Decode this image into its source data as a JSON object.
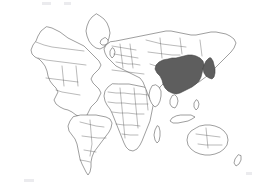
{
  "figure": {
    "type": "world-map",
    "projection": "equirectangular",
    "width": 258,
    "height": 184,
    "background_color": "#ffffff",
    "outline_color": "#4e4e4e",
    "internal_border_color": "#5a5a5a",
    "highlight_fill_color": "#5e5e5e",
    "unhighlighted_fill_color": "#ffffff",
    "has_title": false,
    "has_legend": false,
    "has_labels": false,
    "has_graticule": false
  },
  "highlighted_regions": [
    {
      "name": "China",
      "fill": "#5e5e5e"
    },
    {
      "name": "Japan",
      "fill": "#5e5e5e"
    }
  ],
  "unhighlighted_regions": [
    "North America",
    "Greenland",
    "South America",
    "Europe",
    "Africa",
    "Madagascar",
    "Russia",
    "Middle East",
    "India",
    "Southeast Asia",
    "Indonesia",
    "Philippines",
    "Australia",
    "New Zealand",
    "Iceland",
    "British Isles",
    "Japan"
  ],
  "shapes": {
    "north_america": "M 46 27 L 41 31 L 38 36 L 36 41 L 33 45 L 31 50 L 32 54 L 35 57 L 39 59 L 42 62 L 45 66 L 47 71 L 48 76 L 50 81 L 53 85 L 56 88 L 58 92 L 56 96 L 54 100 L 56 104 L 60 107 L 64 109 L 68 110 L 72 112 L 76 115 L 80 117 L 84 118 L 87 115 L 89 111 L 91 107 L 94 104 L 97 101 L 99 97 L 101 93 L 99 89 L 96 86 L 93 83 L 91 79 L 93 75 L 96 72 L 99 69 L 101 65 L 99 61 L 96 58 L 93 55 L 90 52 L 87 49 L 84 46 L 80 44 L 76 42 L 72 40 L 68 38 L 64 35 L 60 32 L 56 30 L 52 28 L 48 27 Z",
    "greenland": "M 96 14 L 92 17 L 89 21 L 87 26 L 86 31 L 87 36 L 89 41 L 92 45 L 96 48 L 100 49 L 104 47 L 107 43 L 109 38 L 110 33 L 109 28 L 107 23 L 104 19 L 100 16 Z",
    "south_america": "M 73 117 L 70 121 L 68 126 L 69 131 L 72 135 L 75 139 L 77 144 L 78 149 L 79 154 L 80 159 L 82 164 L 84 168 L 86 172 L 88 175 L 90 172 L 91 167 L 91 162 L 92 157 L 94 152 L 97 148 L 100 144 L 103 140 L 106 136 L 109 132 L 111 128 L 112 123 L 110 119 L 106 117 L 101 116 L 96 115 L 91 115 L 86 115 L 81 115 Z",
    "africa": "M 112 84 L 108 87 L 105 91 L 104 96 L 105 101 L 107 105 L 110 109 L 112 113 L 114 118 L 116 123 L 118 128 L 120 133 L 122 138 L 124 143 L 126 147 L 129 150 L 133 151 L 137 149 L 140 145 L 142 141 L 144 136 L 146 131 L 148 126 L 150 121 L 151 116 L 152 111 L 153 106 L 154 101 L 153 96 L 151 92 L 148 89 L 144 87 L 139 86 L 134 85 L 129 84 L 124 84 L 119 84 Z",
    "madagascar": "M 157 126 L 155 130 L 154 135 L 155 140 L 157 143 L 159 141 L 160 136 L 160 131 L 159 127 Z",
    "eurasia": "M 110 42 L 106 45 L 104 49 L 105 53 L 107 57 L 110 60 L 113 63 L 116 66 L 120 68 L 124 70 L 128 72 L 132 74 L 136 76 L 140 78 L 143 82 L 145 87 L 147 92 L 149 97 L 151 101 L 154 99 L 156 95 L 158 91 L 160 87 L 163 84 L 167 83 L 171 84 L 175 86 L 179 88 L 183 89 L 187 88 L 191 86 L 195 84 L 199 82 L 203 79 L 207 76 L 211 72 L 215 68 L 219 64 L 223 60 L 227 56 L 231 52 L 234 48 L 236 43 L 234 39 L 230 36 L 226 34 L 221 33 L 216 32 L 211 32 L 206 33 L 201 34 L 196 35 L 191 35 L 186 34 L 181 33 L 176 32 L 171 31 L 166 31 L 161 32 L 156 33 L 151 34 L 146 35 L 141 36 L 136 37 L 131 38 L 126 39 L 121 40 L 116 41 Z",
    "china": "M 163 60 L 159 62 L 156 65 L 155 69 L 157 73 L 160 76 L 162 80 L 163 84 L 165 88 L 168 91 L 172 93 L 176 94 L 180 93 L 184 91 L 188 89 L 192 87 L 196 84 L 199 81 L 201 77 L 202 73 L 203 69 L 204 65 L 203 61 L 200 58 L 196 56 L 192 55 L 188 55 L 184 56 L 180 57 L 176 58 L 172 58 L 168 59 Z",
    "japan": "M 209 58 L 206 61 L 204 65 L 203 69 L 204 73 L 206 76 L 209 78 L 212 79 L 214 77 L 215 73 L 215 69 L 214 65 L 213 61 L 211 58 Z",
    "india": "M 152 86 L 150 90 L 149 95 L 150 100 L 152 104 L 155 107 L 158 105 L 160 101 L 161 96 L 161 91 L 159 87 L 156 85 Z",
    "southeast_asia": "M 172 96 L 170 100 L 170 104 L 172 107 L 175 108 L 177 105 L 178 101 L 177 97 L 175 95 Z",
    "indonesia": "M 176 116 L 172 118 L 170 121 L 173 123 L 178 123 L 183 122 L 188 121 L 192 119 L 195 117 L 191 115 L 186 115 L 181 115 Z",
    "philippines": "M 196 100 L 194 103 L 194 107 L 196 110 L 198 108 L 199 104 L 198 101 Z",
    "australia": "M 196 128 L 191 131 L 188 135 L 187 140 L 188 145 L 191 149 L 195 152 L 200 154 L 205 155 L 210 155 L 215 154 L 220 152 L 224 149 L 227 145 L 228 140 L 227 135 L 224 131 L 220 128 L 215 126 L 210 125 L 205 125 L 200 126 Z",
    "new_zealand": "M 238 155 L 235 159 L 234 163 L 236 166 L 239 164 L 241 160 L 241 156 Z",
    "iceland": "M 104 38 L 101 40 L 100 43 L 102 45 L 105 45 L 108 43 L 108 40 L 106 38 Z",
    "british_isles": "M 112 48 L 110 51 L 110 55 L 112 58 L 114 56 L 115 52 L 114 49 Z"
  },
  "internal_borders": {
    "north_america_lines": [
      "M 36 42 L 44 45 L 52 47 L 60 48 L 68 49 L 76 50 L 84 51",
      "M 38 58 L 46 60 L 54 61 L 62 62 L 70 63 L 78 64 L 86 65",
      "M 56 90 L 62 92 L 68 93 L 74 94 L 80 95",
      "M 62 66 L 63 76 L 64 86",
      "M 76 66 L 77 76 L 78 86",
      "M 46 78 L 54 79 L 62 80 L 70 81 L 78 82"
    ],
    "south_america_lines": [
      "M 80 122 L 88 124 L 96 126 L 104 127",
      "M 82 136 L 90 137 L 98 138 L 106 138",
      "M 84 150 L 90 151 L 96 152",
      "M 90 120 L 91 132 L 92 144 L 90 156",
      "M 80 160 L 86 161 L 90 162"
    ],
    "europe_lines": [
      "M 112 46 L 118 47 L 124 48 L 130 49 L 136 50",
      "M 114 54 L 120 55 L 126 56 L 132 57 L 138 58",
      "M 116 62 L 122 63 L 128 64 L 134 64 L 140 65",
      "M 120 44 L 121 52 L 122 60 L 123 68",
      "M 130 44 L 131 52 L 132 60 L 133 68",
      "M 112 70 L 120 71 L 128 72 L 136 73 L 144 74"
    ],
    "africa_lines": [
      "M 108 92 L 116 93 L 124 93 L 132 94 L 140 94 L 148 95",
      "M 108 102 L 116 103 L 124 103 L 132 104 L 140 104 L 148 104",
      "M 112 112 L 120 113 L 128 113 L 136 114 L 144 114",
      "M 116 124 L 124 125 L 132 125 L 140 126",
      "M 122 134 L 130 135 L 138 135",
      "M 120 88 L 121 98 L 122 108 L 123 118 L 124 128 L 125 138",
      "M 134 88 L 135 98 L 136 108 L 137 118 L 138 128",
      "M 146 90 L 147 100 L 148 110"
    ],
    "asia_lines": [
      "M 146 40 L 154 42 L 162 44 L 170 45 L 178 46 L 186 47",
      "M 148 52 L 156 53 L 164 54 L 172 55 L 180 55",
      "M 150 64 L 156 66 L 162 68",
      "M 160 38 L 161 48 L 162 58",
      "M 180 38 L 181 46 L 182 54",
      "M 200 40 L 201 48 L 202 56"
    ],
    "australia_lines": [
      "M 196 134 L 204 135 L 212 136 L 220 137",
      "M 198 144 L 206 145 L 214 145 L 222 145",
      "M 206 128 L 207 138 L 208 148"
    ]
  }
}
